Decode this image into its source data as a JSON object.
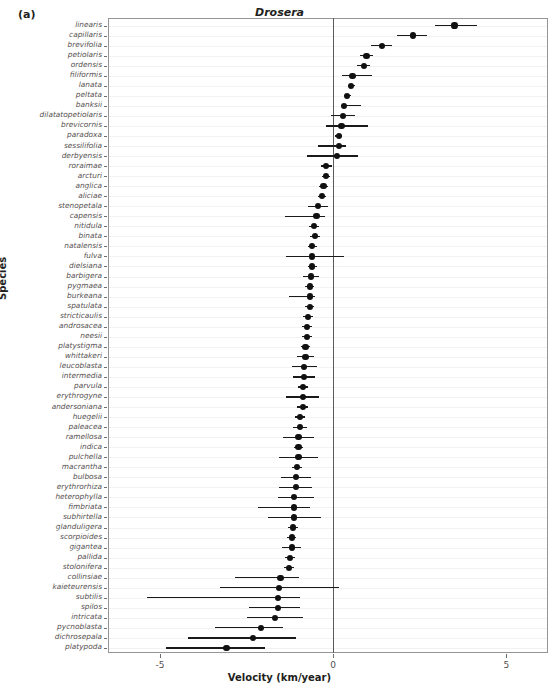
{
  "panel": {
    "label": "(a)"
  },
  "chart_data": {
    "type": "scatter",
    "title": "Drosera",
    "xlabel": "Velocity (km/year)",
    "ylabel": "Species",
    "xlim": [
      -6.5,
      6.2
    ],
    "xticks": [
      -5,
      0,
      5
    ],
    "xtick_labels": [
      "-5",
      "0",
      "5"
    ],
    "grid": true,
    "grid_axis": "y",
    "reference_line_x": 0,
    "orientation": "horizontal",
    "marker": "filled-circle",
    "error_bar_type": "confidence-interval",
    "categories": [
      "linearis",
      "capillaris",
      "brevifolia",
      "petiolaris",
      "ordensis",
      "filiformis",
      "lanata",
      "peltata",
      "banksii",
      "dilatatopetiolaris",
      "brevicornis",
      "paradoxa",
      "sessilifolia",
      "derbyensis",
      "roraimae",
      "arcturi",
      "anglica",
      "aliciae",
      "stenopetala",
      "capensis",
      "nitidula",
      "binata",
      "natalensis",
      "fulva",
      "dielsiana",
      "barbigera",
      "pygmaea",
      "burkeana",
      "spatulata",
      "stricticaulis",
      "androsacea",
      "neesii",
      "platystigma",
      "whittakeri",
      "leucoblasta",
      "intermedia",
      "parvula",
      "erythrogyne",
      "andersoniana",
      "huegelii",
      "paleacea",
      "ramellosa",
      "indica",
      "pulchella",
      "macrantha",
      "bulbosa",
      "erythrorhiza",
      "heterophylla",
      "fimbriata",
      "subhirtella",
      "glanduligera",
      "scorpioides",
      "gigantea",
      "pallida",
      "stolonifera",
      "collinsiae",
      "kaieteurensis",
      "subtilis",
      "spilos",
      "intricata",
      "pycnoblasta",
      "dichrosepala",
      "platypoda"
    ],
    "values": [
      3.5,
      2.3,
      1.4,
      0.96,
      0.88,
      0.56,
      0.52,
      0.4,
      0.32,
      0.28,
      0.24,
      0.16,
      0.16,
      0.12,
      -0.2,
      -0.2,
      -0.28,
      -0.32,
      -0.44,
      -0.48,
      -0.56,
      -0.52,
      -0.6,
      -0.6,
      -0.6,
      -0.64,
      -0.68,
      -0.68,
      -0.68,
      -0.72,
      -0.76,
      -0.76,
      -0.8,
      -0.8,
      -0.84,
      -0.84,
      -0.88,
      -0.88,
      -0.88,
      -0.96,
      -0.96,
      -1.0,
      -1.0,
      -1.0,
      -1.04,
      -1.08,
      -1.08,
      -1.12,
      -1.12,
      -1.12,
      -1.16,
      -1.2,
      -1.2,
      -1.24,
      -1.28,
      -1.52,
      -1.56,
      -1.6,
      -1.6,
      -1.68,
      -2.08,
      -2.32,
      -3.08
    ],
    "ci_low": [
      2.95,
      1.85,
      1.1,
      0.78,
      0.7,
      0.24,
      0.42,
      0.3,
      0.22,
      -0.06,
      -0.2,
      0.06,
      -0.44,
      -0.76,
      -0.36,
      -0.32,
      -0.4,
      -0.44,
      -0.72,
      -1.4,
      -0.7,
      -0.66,
      -0.74,
      -1.36,
      -0.74,
      -0.88,
      -0.82,
      -1.28,
      -0.82,
      -0.86,
      -0.9,
      -0.9,
      -0.94,
      -1.04,
      -1.2,
      -1.16,
      -1.02,
      -1.36,
      -1.04,
      -1.1,
      -1.16,
      -1.44,
      -1.14,
      -1.56,
      -1.18,
      -1.52,
      -1.56,
      -1.6,
      -2.16,
      -1.88,
      -1.3,
      -1.34,
      -1.48,
      -1.38,
      -1.42,
      -2.84,
      -3.28,
      -5.36,
      -2.44,
      -2.48,
      -3.4,
      -4.2,
      -4.84
    ],
    "ci_high": [
      4.14,
      2.72,
      1.7,
      1.14,
      1.06,
      1.12,
      0.62,
      0.5,
      0.8,
      0.62,
      1.0,
      0.26,
      0.36,
      0.72,
      -0.04,
      -0.08,
      -0.16,
      -0.2,
      -0.16,
      -0.24,
      -0.42,
      -0.38,
      -0.46,
      0.3,
      -0.46,
      -0.4,
      -0.54,
      -0.52,
      -0.54,
      -0.58,
      -0.62,
      -0.62,
      -0.66,
      -0.56,
      -0.48,
      -0.52,
      -0.74,
      -0.4,
      -0.72,
      -0.82,
      -0.76,
      -0.56,
      -0.86,
      -0.44,
      -0.9,
      -0.64,
      -0.6,
      -0.56,
      -0.68,
      -0.36,
      -1.02,
      -1.06,
      -0.92,
      -1.1,
      -1.14,
      -1.0,
      0.16,
      -0.96,
      -0.96,
      -0.88,
      -1.44,
      -1.08,
      -1.96
    ]
  }
}
